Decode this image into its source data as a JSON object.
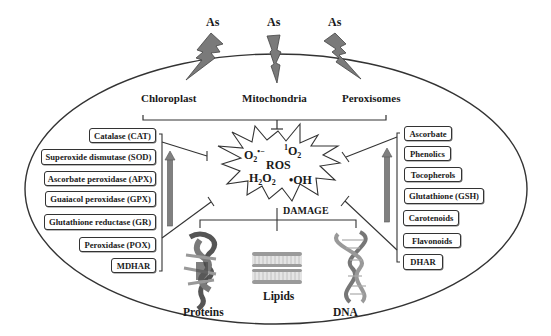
{
  "stressors": [
    {
      "label": "As"
    },
    {
      "label": "As"
    },
    {
      "label": "As"
    }
  ],
  "organelles": [
    {
      "label": "Chloroplast"
    },
    {
      "label": "Mitochondria"
    },
    {
      "label": "Peroxisomes"
    }
  ],
  "ros": {
    "title": "ROS",
    "species": {
      "superoxide": "O2•−",
      "singlet_oxygen": "1O2",
      "hydrogen_peroxide": "H2O2",
      "hydroxyl": "•OH"
    }
  },
  "damage": {
    "label": "DAMAGE",
    "targets": [
      {
        "label": "Proteins"
      },
      {
        "label": "Lipids"
      },
      {
        "label": "DNA"
      }
    ]
  },
  "enzymatic_antioxidants": [
    {
      "label": "Catalase (CAT)"
    },
    {
      "label": "Superoxide dismutase (SOD)"
    },
    {
      "label": "Ascorbate peroxidase (APX)"
    },
    {
      "label": "Guaiacol peroxidase (GPX)"
    },
    {
      "label": "Glutathione reductase (GR)"
    },
    {
      "label": "Peroxidase (POX)"
    },
    {
      "label": "MDHAR"
    }
  ],
  "non_enzymatic_antioxidants": [
    {
      "label": "Ascorbate"
    },
    {
      "label": "Phenolics"
    },
    {
      "label": "Tocopherols"
    },
    {
      "label": "Glutathione (GSH)"
    },
    {
      "label": "Carotenoids"
    },
    {
      "label": "Flavonoids"
    },
    {
      "label": "DHAR"
    }
  ],
  "colors": {
    "outline": "#333333",
    "bolt_fill": "#7a7a7a",
    "arrow_fill": "#808080",
    "lipid_head": "#9a9a9a",
    "background": "#ffffff"
  }
}
